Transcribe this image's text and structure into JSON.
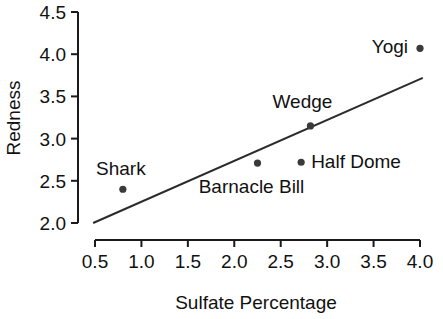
{
  "chart_data": {
    "type": "scatter",
    "title": "",
    "xlabel": "Sulfate Percentage",
    "ylabel": "Redness",
    "xlim": [
      0.5,
      4.0
    ],
    "ylim": [
      2.0,
      4.5
    ],
    "xticks": [
      "0.5",
      "1.0",
      "1.5",
      "2.0",
      "2.5",
      "3.0",
      "3.5",
      "4.0"
    ],
    "xtick_values": [
      0.5,
      1.0,
      1.5,
      2.0,
      2.5,
      3.0,
      3.5,
      4.0
    ],
    "yticks": [
      "2.0",
      "2.5",
      "3.0",
      "3.5",
      "4.0",
      "4.5"
    ],
    "ytick_values": [
      2.0,
      2.5,
      3.0,
      3.5,
      4.0,
      4.5
    ],
    "grid": false,
    "legend": "none",
    "point_color": "#3a3a3a",
    "line_color": "#2b2b2b",
    "axis_color": "#1a1a1a",
    "points": [
      {
        "label": "Shark",
        "x": 0.8,
        "y": 2.4,
        "label_dx": -2,
        "label_dy": -14,
        "label_anchor": "middle"
      },
      {
        "label": "Barnacle Bill",
        "x": 2.25,
        "y": 2.71,
        "label_dx": -6,
        "label_dy": 30,
        "label_anchor": "middle"
      },
      {
        "label": "Half Dome",
        "x": 2.72,
        "y": 2.72,
        "label_dx": 10,
        "label_dy": 6,
        "label_anchor": "start"
      },
      {
        "label": "Wedge",
        "x": 2.82,
        "y": 3.15,
        "label_dx": -8,
        "label_dy": -18,
        "label_anchor": "middle"
      },
      {
        "label": "Yogi",
        "x": 4.0,
        "y": 4.07,
        "label_dx": -12,
        "label_dy": 5,
        "label_anchor": "end"
      }
    ],
    "fit_line": {
      "x0": 0.48,
      "y0": 2.0,
      "x1": 4.03,
      "y1": 3.72,
      "slope": 0.485,
      "intercept": 1.767
    }
  },
  "axes": {
    "x_title": "Sulfate Percentage",
    "y_title": "Redness"
  }
}
